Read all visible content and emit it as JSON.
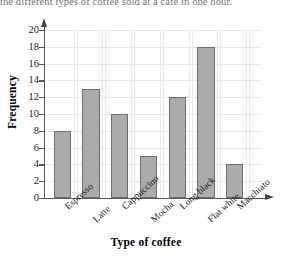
{
  "caption": "the different types of coffee sold at a cafe in one hour.",
  "chart_data": {
    "type": "bar",
    "title": "",
    "categories": [
      "Espresso",
      "Latte",
      "Cappuccino",
      "Mocha",
      "Long black",
      "Flat white",
      "Macchiato"
    ],
    "values": [
      8,
      13,
      10,
      5,
      12,
      18,
      4
    ],
    "xlabel": "Type of coffee",
    "ylabel": "Frequency",
    "ylim": [
      0,
      20
    ],
    "ytick_step": 2,
    "yticks": [
      0,
      2,
      4,
      6,
      8,
      10,
      12,
      14,
      16,
      18,
      20
    ],
    "grid": true,
    "legend": "none",
    "bar_color": "#ababab",
    "bar_border_color": "#6e6e6e",
    "grid_color": "#e9e9e9",
    "axis_color": "#555555"
  }
}
